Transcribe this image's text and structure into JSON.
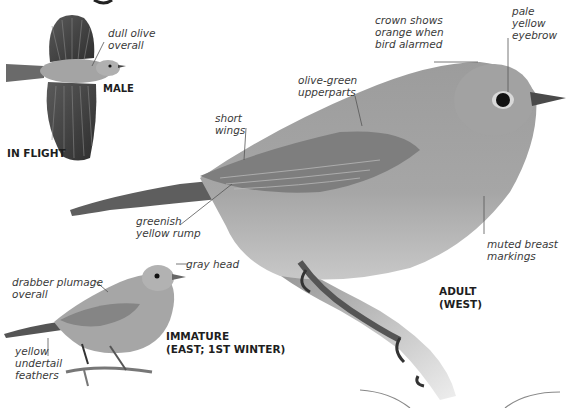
{
  "page": {
    "heading_fragment": "g",
    "figures": {
      "in_flight": {
        "caption": "IN FLIGHT",
        "sex_label": "MALE",
        "annotations": [
          "dull olive",
          "overall"
        ]
      },
      "adult": {
        "caption_line1": "ADULT",
        "caption_line2": "(WEST)",
        "annotations": {
          "crown": [
            "crown shows",
            "orange when",
            "bird alarmed"
          ],
          "eyebrow": [
            "pale",
            "yellow",
            "eyebrow"
          ],
          "upperparts": [
            "olive-green",
            "upperparts"
          ],
          "wings": [
            "short",
            "wings"
          ],
          "rump": [
            "greenish",
            "yellow rump"
          ],
          "breast": [
            "muted breast",
            "markings"
          ]
        }
      },
      "immature": {
        "caption_line1": "IMMATURE",
        "caption_line2": "(EAST; 1ST WINTER)",
        "annotations": {
          "head": [
            "gray head"
          ],
          "plumage": [
            "drabber plumage",
            "overall"
          ],
          "undertail": [
            "yellow",
            "undertail",
            "feathers"
          ]
        }
      }
    },
    "colors": {
      "text": "#3a3a3a",
      "caption": "#1e1e1e",
      "bird_body": "#9a9a9a",
      "bird_dark": "#4a4a4a",
      "leader_line": "#555555"
    }
  }
}
